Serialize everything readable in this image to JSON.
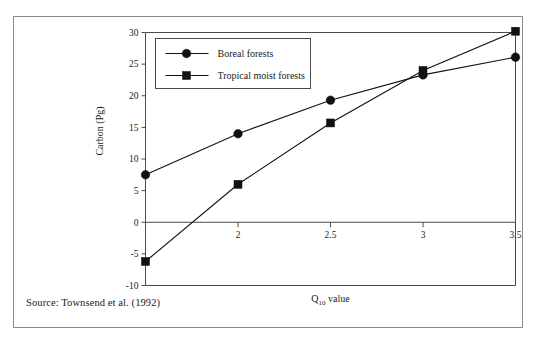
{
  "figure": {
    "source_note": "Source: Townsend et al. (1992)"
  },
  "chart_data": {
    "type": "line",
    "title": "",
    "xlabel": "Q10 value",
    "xlabel_base": "Q",
    "xlabel_sub": "10",
    "xlabel_tail": " value",
    "ylabel": "Carbon (Pg)",
    "x": [
      1.5,
      2,
      2.5,
      3,
      3.5
    ],
    "xlim": [
      1.5,
      3.5
    ],
    "ylim": [
      -10,
      30
    ],
    "xticks": [
      2,
      2.5,
      3,
      3.5
    ],
    "xtick_labels": [
      "2",
      "2.5",
      "3",
      "3.5"
    ],
    "yticks": [
      -10,
      -5,
      0,
      5,
      10,
      15,
      20,
      25,
      30
    ],
    "ytick_labels": [
      "-10",
      "-5",
      "0",
      "5",
      "10",
      "15",
      "20",
      "25",
      "30"
    ],
    "grid": false,
    "legend_position": "upper left",
    "series": [
      {
        "name": "Boreal forests",
        "marker": "circle",
        "color": "#111111",
        "values": [
          7.5,
          14.0,
          19.3,
          23.3,
          26.1
        ]
      },
      {
        "name": "Tropical moist forests",
        "marker": "square",
        "color": "#111111",
        "values": [
          -6.2,
          6.0,
          15.7,
          24.0,
          30.2
        ]
      }
    ]
  },
  "icons": {
    "circle_marker": "circle-marker-icon",
    "square_marker": "square-marker-icon"
  }
}
